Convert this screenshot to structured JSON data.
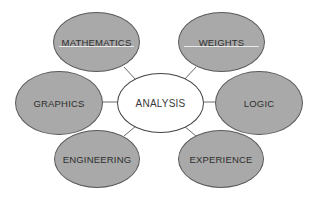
{
  "diagram": {
    "type": "hub-and-spoke concept map",
    "center": {
      "label": "ANALYSIS",
      "x": 117,
      "y": 73,
      "w": 87,
      "h": 60,
      "fill": "#ffffff"
    },
    "satellites": [
      {
        "id": "mathematics",
        "label": "MATHEMATICS",
        "x": 53,
        "y": 12,
        "w": 87,
        "h": 60,
        "sheen": true
      },
      {
        "id": "weights",
        "label": "WEIGHTS",
        "x": 178,
        "y": 12,
        "w": 87,
        "h": 60,
        "sheen": true
      },
      {
        "id": "graphics",
        "label": "GRAPHICS",
        "x": 15,
        "y": 71,
        "w": 88,
        "h": 64,
        "sheen": false
      },
      {
        "id": "logic",
        "label": "LOGIC",
        "x": 215,
        "y": 71,
        "w": 88,
        "h": 64,
        "sheen": false
      },
      {
        "id": "engineering",
        "label": "ENGINEERING",
        "x": 54,
        "y": 130,
        "w": 86,
        "h": 58,
        "sheen": false
      },
      {
        "id": "experience",
        "label": "EXPERIENCE",
        "x": 178,
        "y": 130,
        "w": 86,
        "h": 58,
        "sheen": false
      }
    ],
    "connectors": [
      {
        "from": "analysis",
        "to": "mathematics",
        "x1": 136,
        "y1": 80,
        "x2": 124,
        "y2": 67
      },
      {
        "from": "analysis",
        "to": "weights",
        "x1": 184,
        "y1": 80,
        "x2": 196,
        "y2": 67
      },
      {
        "from": "analysis",
        "to": "graphics",
        "x1": 117,
        "y1": 102,
        "x2": 103,
        "y2": 102
      },
      {
        "from": "analysis",
        "to": "logic",
        "x1": 204,
        "y1": 102,
        "x2": 215,
        "y2": 102
      },
      {
        "from": "analysis",
        "to": "engineering",
        "x1": 136,
        "y1": 126,
        "x2": 124,
        "y2": 136
      },
      {
        "from": "analysis",
        "to": "experience",
        "x1": 184,
        "y1": 126,
        "x2": 196,
        "y2": 136
      }
    ],
    "colors": {
      "satellite_fill": "#a9a9a9",
      "outline": "#5a5a5a",
      "connector": "#6a6a6a",
      "text": "#2e2e2e",
      "background": "#ffffff"
    }
  }
}
